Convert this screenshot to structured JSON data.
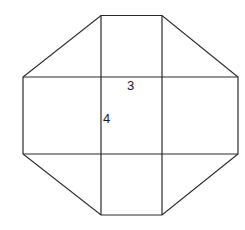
{
  "diagram": {
    "labels": {
      "width_label": "3",
      "height_label": "4"
    },
    "colors": {
      "stroke": "#2a2a2a",
      "background": "#ffffff",
      "text": "#1a1a1a"
    }
  }
}
